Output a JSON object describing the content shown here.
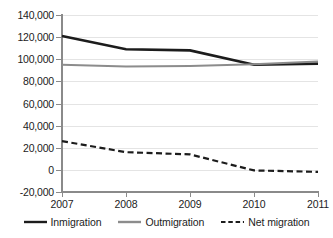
{
  "chart_data": {
    "type": "line",
    "title": "",
    "xlabel": "",
    "ylabel": "",
    "x": [
      "2007",
      "2008",
      "2009",
      "2010",
      "2011"
    ],
    "categories": [
      "2007",
      "2008",
      "2009",
      "2010",
      "2011"
    ],
    "ylim": [
      -20000,
      140000
    ],
    "xlim": [
      "2007",
      "2011"
    ],
    "ytick_labels": [
      "140,000",
      "120,000",
      "100,000",
      "80,000",
      "60,000",
      "40,000",
      "20,000",
      "0",
      "-20,000"
    ],
    "ytick_values": [
      140000,
      120000,
      100000,
      80000,
      60000,
      40000,
      20000,
      0,
      -20000
    ],
    "xtick_labels": [
      "2007",
      "2008",
      "2009",
      "2010",
      "2011"
    ],
    "grid": true,
    "grid_axis": "y",
    "legend_position": "bottom",
    "series": [
      {
        "name": "Inmigration",
        "values": [
          121000,
          109000,
          108000,
          95000,
          96000
        ],
        "color": "#1c1c1c",
        "style": "solid",
        "width": 2.6
      },
      {
        "name": "Outmigration",
        "values": [
          95000,
          93500,
          94000,
          95500,
          98000
        ],
        "color": "#8c8c8c",
        "style": "solid",
        "width": 2.0
      },
      {
        "name": "Net migration",
        "values": [
          26000,
          16000,
          14000,
          -500,
          -1800
        ],
        "color": "#1c1c1c",
        "style": "dashed",
        "width": 2.2
      }
    ]
  },
  "legend": {
    "items": [
      {
        "label": "Inmigration",
        "color": "#1c1c1c",
        "style": "solid"
      },
      {
        "label": "Outmigration",
        "color": "#8c8c8c",
        "style": "solid"
      },
      {
        "label": "Net migration",
        "color": "#1c1c1c",
        "style": "dashed"
      }
    ]
  },
  "axes": {
    "y_labels": [
      "140,000",
      "120,000",
      "100,000",
      "80,000",
      "60,000",
      "40,000",
      "20,000",
      "0",
      "-20,000"
    ],
    "x_labels": [
      "2007",
      "2008",
      "2009",
      "2010",
      "2011"
    ]
  },
  "colors": {
    "gridline": "#e4e4e4",
    "axis": "#8a8a8a",
    "text": "#1c1c1c",
    "background": "#ffffff"
  }
}
